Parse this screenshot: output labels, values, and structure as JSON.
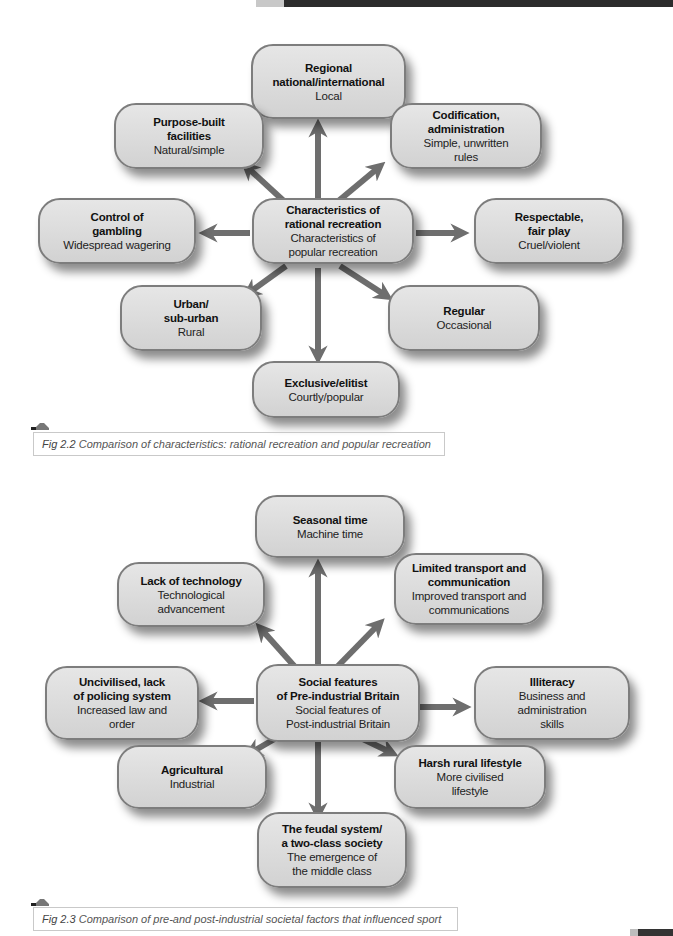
{
  "page_decor": {
    "top_bar": "dark header strip",
    "bottom_corner": "dark page tab"
  },
  "figures": [
    {
      "caption_number": "Fig 2.2",
      "caption_text": "Comparison of characteristics: rational recreation and popular recreation",
      "center": {
        "bold": "Characteristics of\nrational recreation",
        "normal": "Characteristics of\npopular recreation"
      },
      "nodes": {
        "top": {
          "bold": "Regional\nnational/international",
          "normal": "Local"
        },
        "top_left": {
          "bold": "Purpose-built\nfacilities",
          "normal": "Natural/simple"
        },
        "top_right": {
          "bold": "Codification,\nadministration",
          "normal": "Simple, unwritten\nrules"
        },
        "left": {
          "bold": "Control of\ngambling",
          "normal": "Widespread wagering"
        },
        "right": {
          "bold": "Respectable,\nfair play",
          "normal": "Cruel/violent"
        },
        "bottom_left": {
          "bold": "Urban/\nsub-urban",
          "normal": "Rural"
        },
        "bottom_right": {
          "bold": "Regular",
          "normal": "Occasional"
        },
        "bottom": {
          "bold": "Exclusive/elitist",
          "normal": "Courtly/popular"
        }
      }
    },
    {
      "caption_number": "Fig 2.3",
      "caption_text": "Comparison of pre-and post-industrial societal factors that influenced sport",
      "center": {
        "bold": "Social features\nof Pre-industrial Britain",
        "normal": "Social features of\nPost-industrial Britain"
      },
      "nodes": {
        "top": {
          "bold": "Seasonal time",
          "normal": "Machine time"
        },
        "top_left": {
          "bold": "Lack of technology",
          "normal": "Technological\nadvancement"
        },
        "top_right": {
          "bold": "Limited transport and\ncommunication",
          "normal": "Improved transport and\ncommunications"
        },
        "left": {
          "bold": "Uncivilised, lack\nof policing system",
          "normal": "Increased law and\norder"
        },
        "right": {
          "bold": "Illiteracy",
          "normal": "Business and administration\nskills"
        },
        "bottom_left": {
          "bold": "Agricultural",
          "normal": "Industrial"
        },
        "bottom_right": {
          "bold": "Harsh rural lifestyle",
          "normal": "More civilised\nlifestyle"
        },
        "bottom": {
          "bold": "The feudal system/\na two-class society",
          "normal": "The emergence of\nthe middle class"
        }
      }
    }
  ],
  "colors": {
    "node_fill": "#dcdcdc",
    "node_border": "#7d7d7d",
    "arrow": "#6e6e6e",
    "caption_border": "#c9c9c9"
  }
}
